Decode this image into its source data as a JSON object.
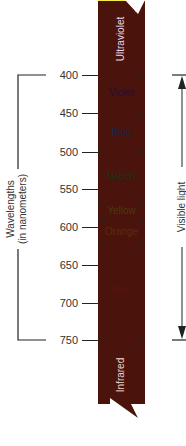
{
  "diagram": {
    "axis_label_line1": "Wavelengths",
    "axis_label_line2": "(in nanometers)",
    "right_label": "Visible light",
    "ticks": [
      {
        "value": "400",
        "y": 75
      },
      {
        "value": "450",
        "y": 113
      },
      {
        "value": "500",
        "y": 152
      },
      {
        "value": "550",
        "y": 189
      },
      {
        "value": "600",
        "y": 227
      },
      {
        "value": "650",
        "y": 265
      },
      {
        "value": "700",
        "y": 303
      },
      {
        "value": "750",
        "y": 340
      }
    ],
    "bands": {
      "ultraviolet": "Ultraviolet",
      "violet": "Violet",
      "blue": "Blue",
      "green": "Green",
      "yellow": "Yellow",
      "orange": "Orange",
      "red": "Red",
      "infrared": "Infrared"
    },
    "colors": {
      "ultraviolet": "#3a1230",
      "violet": "#6a2f7a",
      "blue": "#4aa3de",
      "green": "#5db85a",
      "yellow": "#f3ea4a",
      "orange": "#f5a04a",
      "red": "#ef4a30",
      "infrared": "#4a140c"
    }
  }
}
